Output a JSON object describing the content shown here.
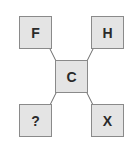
{
  "diagram": {
    "nodes": [
      {
        "id": "top-left",
        "label": "F"
      },
      {
        "id": "top-right",
        "label": "H"
      },
      {
        "id": "center",
        "label": "C"
      },
      {
        "id": "bottom-left",
        "label": "?"
      },
      {
        "id": "bottom-right",
        "label": "X"
      }
    ],
    "edges": [
      {
        "from": "center",
        "to": "top-left"
      },
      {
        "from": "center",
        "to": "top-right"
      },
      {
        "from": "center",
        "to": "bottom-left"
      },
      {
        "from": "center",
        "to": "bottom-right"
      }
    ],
    "colors": {
      "box_fill": "#e4e4e4",
      "box_border": "#8a8a8a",
      "line": "#6a6a6a",
      "text": "#2a2a2a"
    }
  }
}
